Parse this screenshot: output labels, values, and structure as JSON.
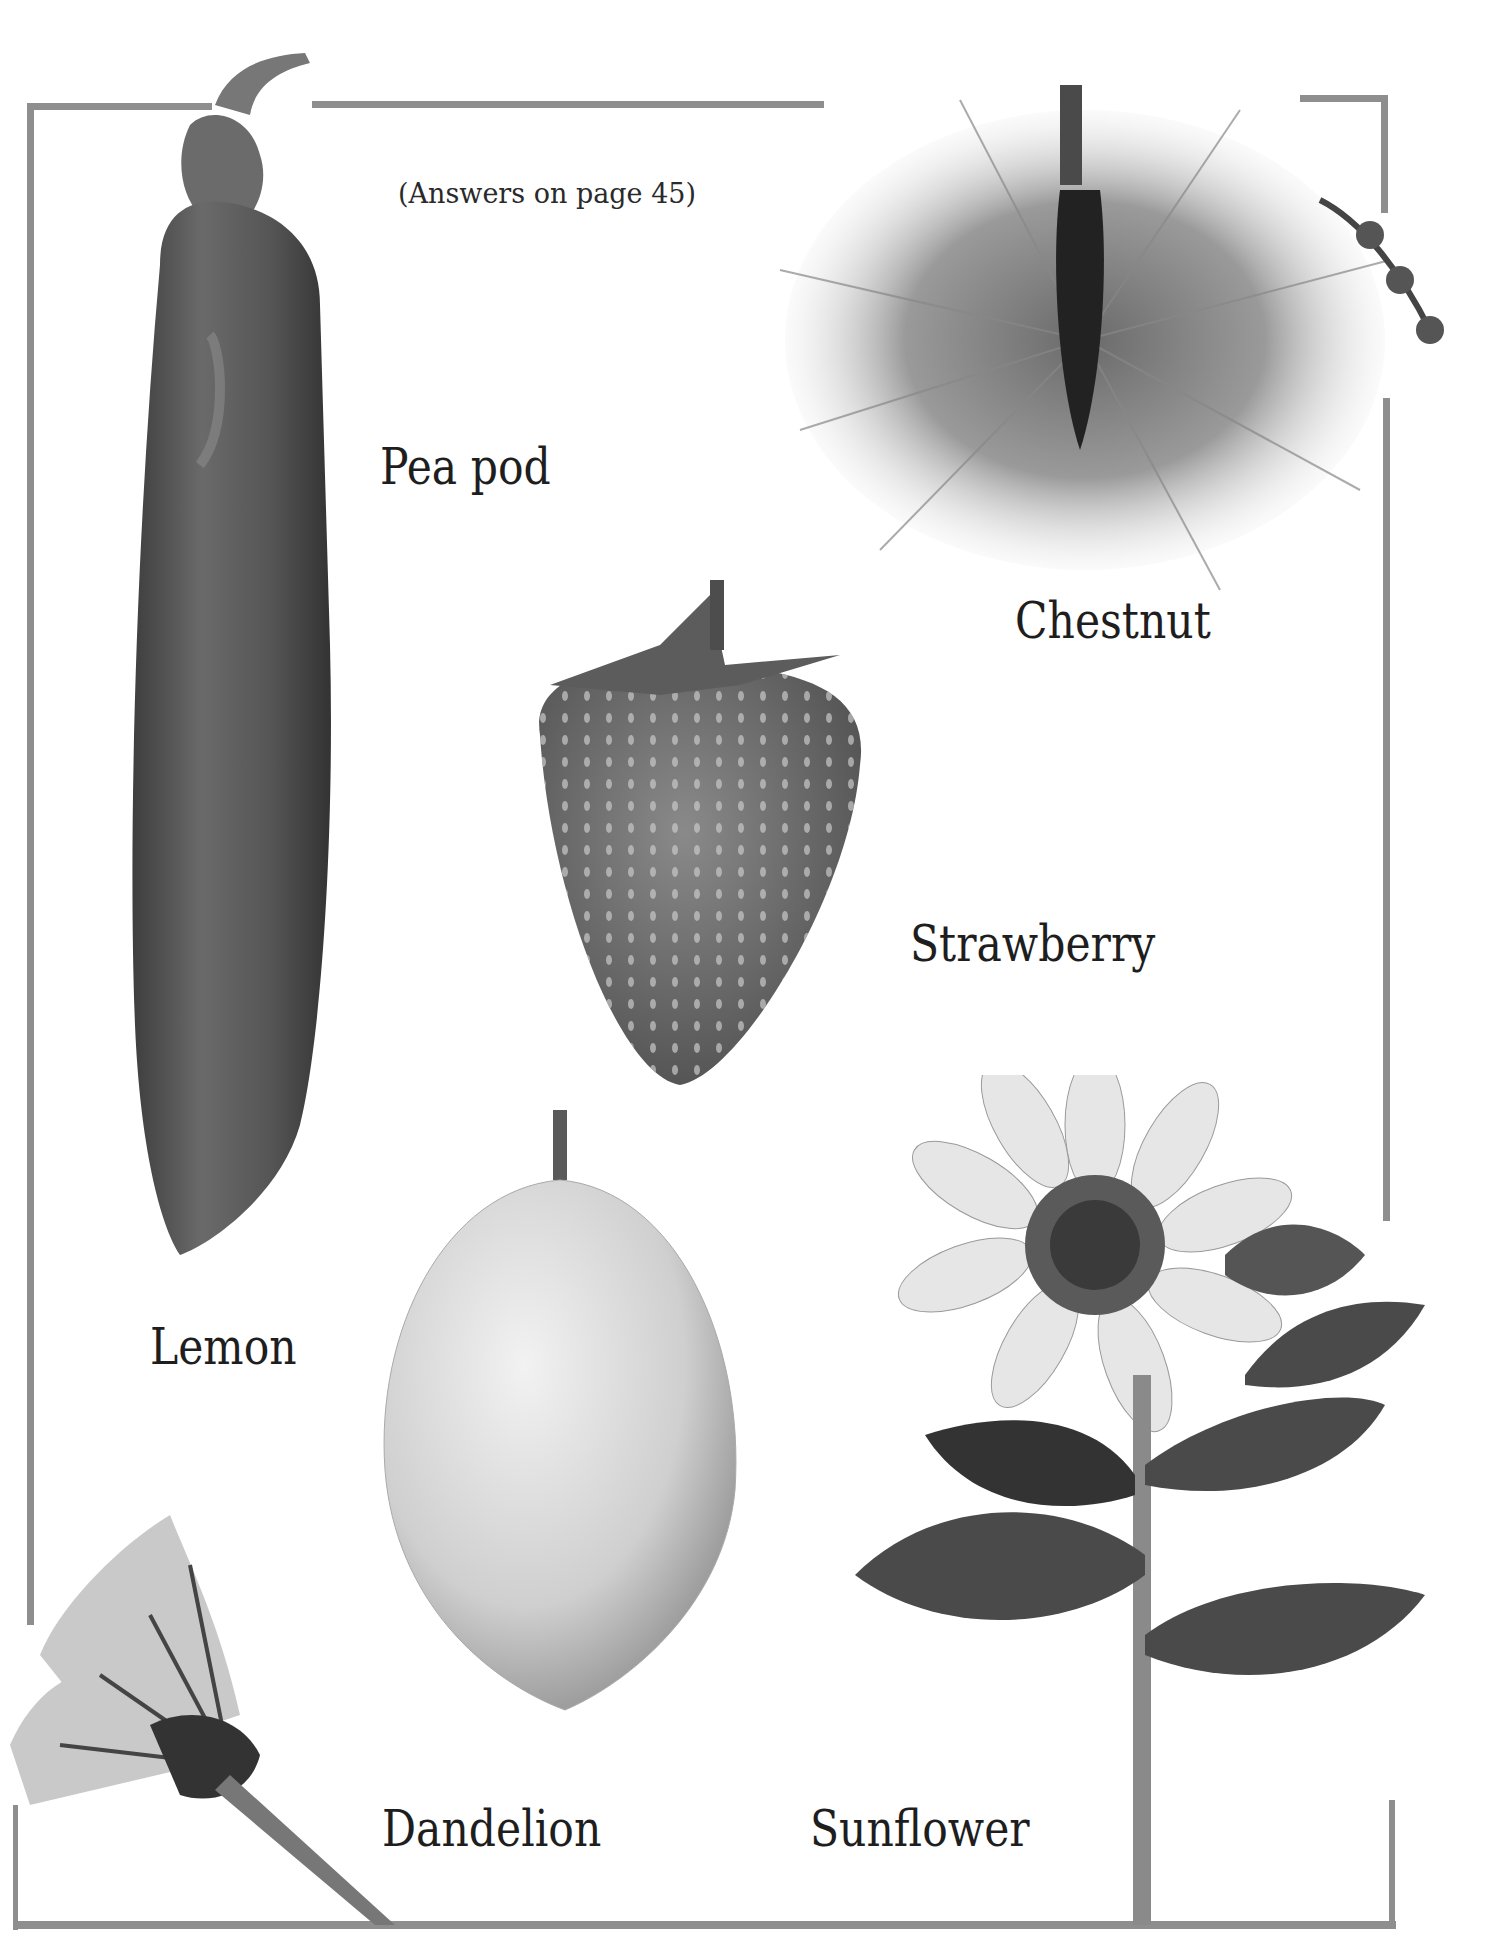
{
  "page": {
    "caption": "(Answers on page 45)",
    "frame_color": "#8e8e8e"
  },
  "items": [
    {
      "label": "Pea pod",
      "image": "pea-pod-photo"
    },
    {
      "label": "Chestnut",
      "image": "chestnut-photo"
    },
    {
      "label": "Strawberry",
      "image": "strawberry-photo"
    },
    {
      "label": "Lemon",
      "image": "lemon-photo"
    },
    {
      "label": "Dandelion",
      "image": "dandelion-photo"
    },
    {
      "label": "Sunflower",
      "image": "sunflower-photo"
    }
  ]
}
